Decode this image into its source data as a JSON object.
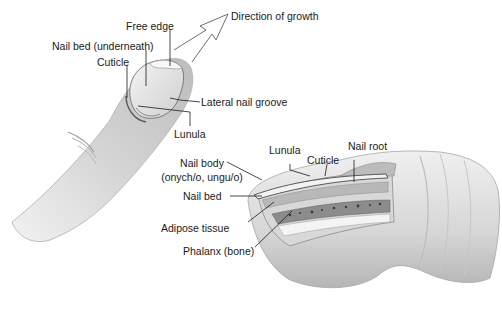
{
  "diagram": {
    "palette": {
      "skin_light": "#ececec",
      "skin_mid": "#c9c9c9",
      "skin_dark": "#9a9a9a",
      "line": "#1a1a1a",
      "background": "#ffffff"
    },
    "top_figure": {
      "labels": {
        "direction": "Direction of growth",
        "free_edge": "Free edge",
        "nail_bed_under": "Nail bed (underneath)",
        "cuticle": "Cuticle",
        "lateral_groove": "Lateral nail groove",
        "lunula": "Lunula"
      }
    },
    "cross_section": {
      "labels": {
        "lunula": "Lunula",
        "cuticle": "Cuticle",
        "nail_root": "Nail root",
        "nail_body_1": "Nail body",
        "nail_body_2": "(onych/o, ungu/o)",
        "nail_bed": "Nail bed",
        "adipose": "Adipose tissue",
        "phalanx": "Phalanx (bone)"
      }
    }
  }
}
